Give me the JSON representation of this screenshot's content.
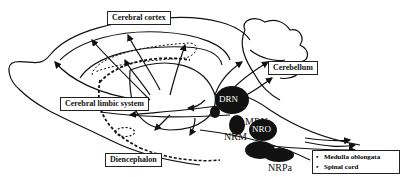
{
  "diagram": {
    "type": "sagittal brain section with serotonergic projection pathways",
    "labels": {
      "cerebral_cortex": "Cerebral cortex",
      "cerebellum": "Cerebellum",
      "cerebral_limbic_system": "Cerebral limbic system",
      "diencephalon": "Diencephalon"
    },
    "nuclei": {
      "drn": "DRN",
      "mrn": "MRN",
      "nrm": "NRM",
      "nro": "NRO",
      "nrpa": "NRPa"
    },
    "legend": {
      "items": [
        {
          "bullet": "•",
          "label": "Medulla oblongata"
        },
        {
          "bullet": "•",
          "label": "Spinal cord"
        }
      ]
    },
    "colors": {
      "stroke": "#111111",
      "nucleus_fill": "#111111",
      "background": "#ffffff"
    }
  }
}
